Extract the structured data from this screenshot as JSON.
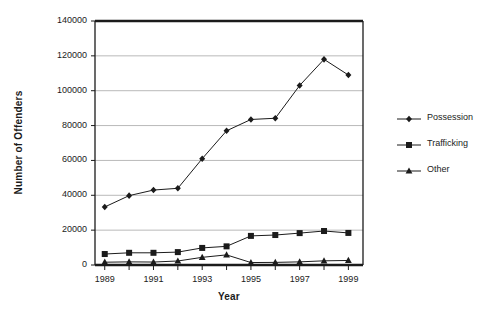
{
  "chart_data": {
    "type": "line",
    "title": "",
    "xlabel": "Year",
    "ylabel": "Number of Offenders",
    "x": [
      1989,
      1990,
      1991,
      1992,
      1993,
      1994,
      1995,
      1996,
      1997,
      1998,
      1999
    ],
    "x_tick_labels": [
      "1989",
      "1991",
      "1993",
      "1995",
      "1997",
      "1999"
    ],
    "y_tick_labels": [
      "0",
      "20000",
      "40000",
      "60000",
      "80000",
      "100000",
      "120000",
      "140000"
    ],
    "y_ticks": [
      0,
      20000,
      40000,
      60000,
      80000,
      100000,
      120000,
      140000
    ],
    "xlim": [
      1988.6,
      1999.6
    ],
    "ylim": [
      0,
      140000
    ],
    "grid": "horizontal",
    "legend_position": "right",
    "series": [
      {
        "name": "Possession",
        "marker": "diamond",
        "color": "#1b1b1b",
        "values": [
          33300,
          39800,
          43000,
          44000,
          61000,
          77000,
          83500,
          84200,
          103000,
          118000,
          109000
        ]
      },
      {
        "name": "Trafficking",
        "marker": "square",
        "color": "#1b1b1b",
        "values": [
          6300,
          7000,
          7000,
          7400,
          9800,
          10700,
          16700,
          17200,
          18300,
          19500,
          18400
        ]
      },
      {
        "name": "Other",
        "marker": "triangle",
        "color": "#1b1b1b",
        "values": [
          1600,
          1800,
          1700,
          2300,
          4400,
          5800,
          1400,
          1500,
          1800,
          2400,
          2600
        ]
      }
    ]
  },
  "axes": {
    "y_title": "Number of Offenders",
    "x_title": "Year"
  },
  "legend": {
    "items": [
      {
        "label": "Possession",
        "marker": "diamond"
      },
      {
        "label": "Trafficking",
        "marker": "square"
      },
      {
        "label": "Other",
        "marker": "triangle"
      }
    ]
  },
  "style": {
    "line_color": "#1b1b1b",
    "grid_color": "#b9b9b9",
    "frame_color": "#1b1b1b",
    "background": "#ffffff"
  }
}
